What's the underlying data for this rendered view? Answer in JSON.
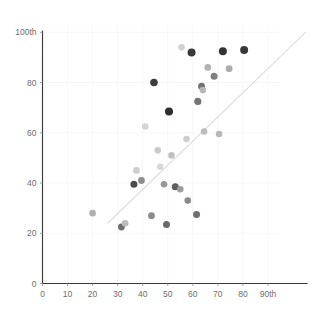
{
  "chart_data": {
    "type": "scatter",
    "title": "",
    "subtitle": "",
    "xlabel": "",
    "ylabel": "",
    "xlim": [
      0,
      95
    ],
    "ylim": [
      0,
      103
    ],
    "grid": true,
    "legend": null,
    "x_ticks": [
      0,
      10,
      20,
      30,
      40,
      50,
      60,
      70,
      80,
      90
    ],
    "x_tick_labels": [
      "0",
      "10",
      "20",
      "30",
      "40",
      "50",
      "60",
      "70",
      "80",
      "90th"
    ],
    "y_ticks": [
      0,
      20,
      40,
      60,
      80,
      100
    ],
    "y_tick_labels": [
      "0",
      "20",
      "40",
      "60",
      "80",
      "100th"
    ],
    "annotations": [],
    "trendline": {
      "type": "line",
      "x_start": 26,
      "y_start": 24,
      "x_end": 105,
      "y_end": 100,
      "color": "#dedede"
    },
    "points": [
      {
        "x": 20.0,
        "y": 28.0,
        "color": "#b0b0b0",
        "r": 3.3
      },
      {
        "x": 31.5,
        "y": 22.5,
        "color": "#6f6f6f",
        "r": 3.4
      },
      {
        "x": 33.0,
        "y": 24.0,
        "color": "#bcbcbc",
        "r": 3.3
      },
      {
        "x": 36.5,
        "y": 39.5,
        "color": "#4a4a4a",
        "r": 3.5
      },
      {
        "x": 37.5,
        "y": 45.0,
        "color": "#cfcfcf",
        "r": 3.4
      },
      {
        "x": 39.5,
        "y": 41.0,
        "color": "#8f8f8f",
        "r": 3.4
      },
      {
        "x": 41.0,
        "y": 62.5,
        "color": "#d5d5d5",
        "r": 3.3
      },
      {
        "x": 43.5,
        "y": 27.0,
        "color": "#8a8a8a",
        "r": 3.4
      },
      {
        "x": 44.5,
        "y": 80.0,
        "color": "#3c3c3c",
        "r": 3.8
      },
      {
        "x": 46.0,
        "y": 53.0,
        "color": "#cacaca",
        "r": 3.3
      },
      {
        "x": 47.0,
        "y": 46.5,
        "color": "#d8d8d8",
        "r": 3.2
      },
      {
        "x": 48.5,
        "y": 39.5,
        "color": "#989898",
        "r": 3.3
      },
      {
        "x": 49.5,
        "y": 23.5,
        "color": "#6a6a6a",
        "r": 3.5
      },
      {
        "x": 50.5,
        "y": 68.5,
        "color": "#2e2e2e",
        "r": 4.0
      },
      {
        "x": 51.5,
        "y": 51.0,
        "color": "#c0c0c0",
        "r": 3.3
      },
      {
        "x": 53.0,
        "y": 38.5,
        "color": "#5e5e5e",
        "r": 3.5
      },
      {
        "x": 55.0,
        "y": 37.5,
        "color": "#9e9e9e",
        "r": 3.3
      },
      {
        "x": 55.5,
        "y": 94.0,
        "color": "#d2d2d2",
        "r": 3.3
      },
      {
        "x": 57.5,
        "y": 57.5,
        "color": "#cdcdcd",
        "r": 3.3
      },
      {
        "x": 58.0,
        "y": 33.0,
        "color": "#8b8b8b",
        "r": 3.3
      },
      {
        "x": 59.5,
        "y": 92.0,
        "color": "#3a3a3a",
        "r": 4.0
      },
      {
        "x": 61.5,
        "y": 27.5,
        "color": "#707070",
        "r": 3.5
      },
      {
        "x": 62.0,
        "y": 72.5,
        "color": "#747474",
        "r": 3.6
      },
      {
        "x": 63.5,
        "y": 78.5,
        "color": "#737373",
        "r": 3.5
      },
      {
        "x": 64.0,
        "y": 77.0,
        "color": "#b6b6b6",
        "r": 3.3
      },
      {
        "x": 64.5,
        "y": 60.5,
        "color": "#bcbcbc",
        "r": 3.3
      },
      {
        "x": 66.0,
        "y": 86.0,
        "color": "#b4b4b4",
        "r": 3.4
      },
      {
        "x": 68.5,
        "y": 82.5,
        "color": "#7f7f7f",
        "r": 3.5
      },
      {
        "x": 70.5,
        "y": 59.5,
        "color": "#b8b8b8",
        "r": 3.3
      },
      {
        "x": 72.0,
        "y": 92.5,
        "color": "#343434",
        "r": 4.0
      },
      {
        "x": 74.5,
        "y": 85.5,
        "color": "#aeaeae",
        "r": 3.4
      },
      {
        "x": 80.5,
        "y": 93.0,
        "color": "#383838",
        "r": 4.0
      }
    ]
  },
  "axes": {
    "origin_label_x": "0",
    "origin_label_y": "0"
  }
}
